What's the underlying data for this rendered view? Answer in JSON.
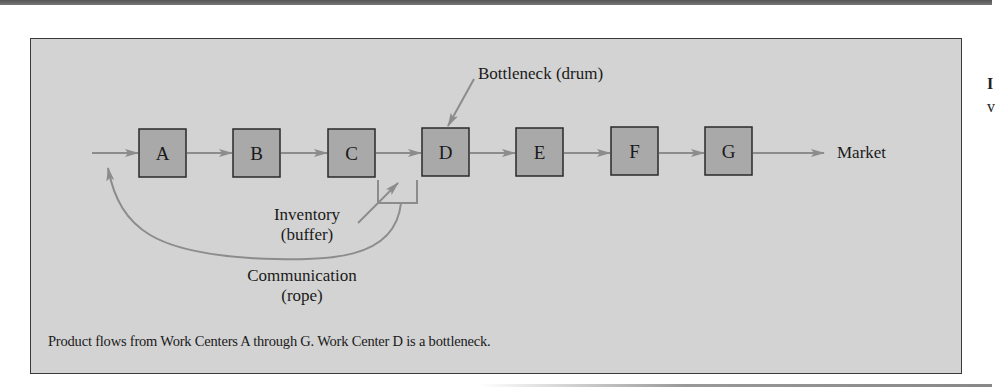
{
  "figure": {
    "work_centers": [
      {
        "id": "A",
        "label": "A",
        "x": 139
      },
      {
        "id": "B",
        "label": "B",
        "x": 233
      },
      {
        "id": "C",
        "label": "C",
        "x": 328
      },
      {
        "id": "D",
        "label": "D",
        "x": 422
      },
      {
        "id": "E",
        "label": "E",
        "x": 516
      },
      {
        "id": "F",
        "label": "F",
        "x": 611
      },
      {
        "id": "G",
        "label": "G",
        "x": 705
      }
    ],
    "bottleneck_label": "Bottleneck (drum)",
    "market_label": "Market",
    "inventory_label_line1": "Inventory",
    "inventory_label_line2": "(buffer)",
    "communication_label_line1": "Communication",
    "communication_label_line2": "(rope)",
    "caption": "Product flows from Work Centers A through G. Work Center D is a bottleneck.",
    "colors": {
      "panel_bg": "#d3d3d3",
      "box_fill": "#a9a9a9",
      "box_border": "#2a2a2a",
      "arrow": "#8c8c8c"
    }
  },
  "edge_fragments": {
    "glyph1": "I",
    "glyph2": "v"
  }
}
